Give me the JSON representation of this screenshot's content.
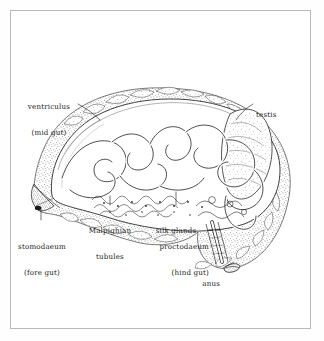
{
  "figure": {
    "background_color": "#ffffff",
    "frame_color": "#b9b9b9",
    "ink_color": "#1a1a1a",
    "technique": "stippled pen-and-ink anatomical illustration"
  },
  "labels": {
    "ventriculus": {
      "line1": "ventriculus",
      "line2": "(mid gut)"
    },
    "testis": {
      "line1": "testis"
    },
    "stomodaeum": {
      "line1": "stomodaeum",
      "line2": "(fore gut)"
    },
    "malpighian": {
      "line1": "Malpighian",
      "line2": "tubules"
    },
    "silk_glands": {
      "line1": "silk glands"
    },
    "proctodaeum": {
      "line1": "proctodaeum",
      "line2": "(hind gut)"
    },
    "anus": {
      "line1": "anus"
    }
  }
}
